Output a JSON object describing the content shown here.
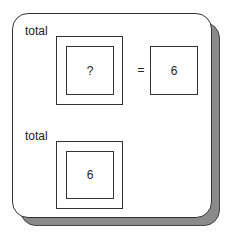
{
  "rows": [
    {
      "label": "total",
      "inner_value": "?",
      "operator": "=",
      "result": "6"
    },
    {
      "label": "total",
      "inner_value": "6"
    }
  ]
}
